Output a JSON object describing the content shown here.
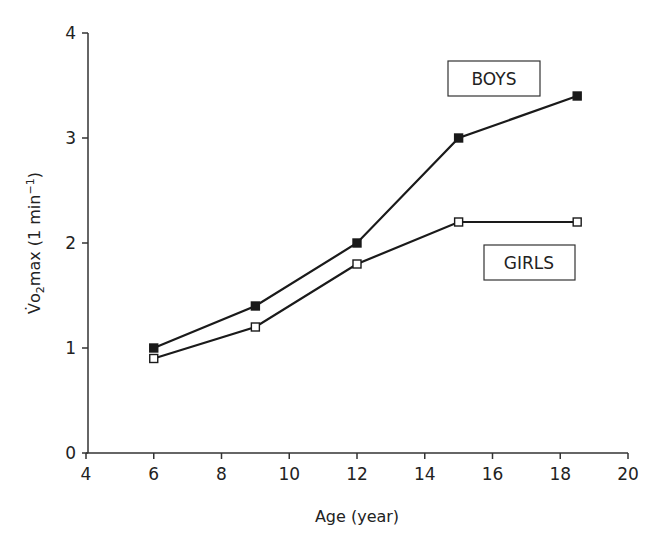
{
  "chart_data": {
    "type": "line",
    "title": "",
    "xlabel": "Age (year)",
    "ylabel": "V̇o2max (1 min−1)",
    "ylabel_parts": {
      "main": "V̇o",
      "sub": "2",
      "rest": "max (1 min",
      "sup": "−1",
      "close": ")"
    },
    "xlim": [
      4,
      20
    ],
    "ylim": [
      0,
      4
    ],
    "xticks": [
      4,
      6,
      8,
      10,
      12,
      14,
      16,
      18,
      20
    ],
    "yticks": [
      0,
      1,
      2,
      3,
      4
    ],
    "grid": false,
    "legend_position": "inline boxed labels near series",
    "series": [
      {
        "name": "BOYS",
        "marker": "filled-square",
        "color": "#1a1a1a",
        "x": [
          6,
          9,
          12,
          15,
          18.5
        ],
        "values": [
          1.0,
          1.4,
          2.0,
          3.0,
          3.4
        ]
      },
      {
        "name": "GIRLS",
        "marker": "open-square",
        "color": "#1a1a1a",
        "x": [
          6,
          9,
          12,
          15,
          18.5
        ],
        "values": [
          0.9,
          1.2,
          1.8,
          2.2,
          2.2
        ]
      }
    ]
  },
  "legend": {
    "boys_label": "BOYS",
    "girls_label": "GIRLS"
  }
}
